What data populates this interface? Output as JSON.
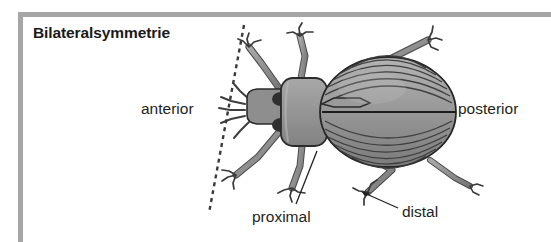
{
  "figure": {
    "title": "Bilateralsymmetrie",
    "border_color": "#a6a6a6",
    "background_color": "#ffffff",
    "ink_color": "#231f20"
  },
  "labels": {
    "anterior": "anterior",
    "posterior": "posterior",
    "proximal": "proximal",
    "distal": "distal"
  },
  "annotations": {
    "symmetry_axis": {
      "name": "dashed-symmetry-axis",
      "style": "dashed",
      "from": [
        244,
        25
      ],
      "to": [
        209,
        213
      ]
    },
    "proximal_leader": {
      "name": "proximal-leader-line",
      "from": [
        296,
        204
      ],
      "to": [
        316,
        152
      ]
    },
    "distal_leader": {
      "name": "distal-leader-line",
      "from": [
        398,
        208
      ],
      "to": [
        358,
        191
      ],
      "arrow": true
    }
  },
  "anatomy": {
    "parts": [
      "head",
      "pronotum",
      "elytra",
      "antenna-left",
      "antenna-right",
      "legs"
    ],
    "elytra_stria_count": 11,
    "leg_count": 6,
    "fill_light": "#9d9d9d",
    "fill_mid": "#8a8a8a",
    "fill_dark": "#5d5d5d",
    "outline": "#2b2b2b"
  }
}
